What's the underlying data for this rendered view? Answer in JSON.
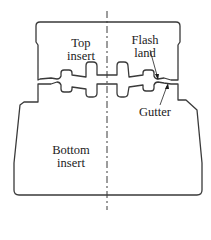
{
  "diagram": {
    "type": "closed-die forging cross-section",
    "labels": {
      "top_insert": [
        "Top",
        "insert"
      ],
      "bottom_insert": [
        "Bottom",
        "insert"
      ],
      "flash_land": [
        "Flash",
        "land"
      ],
      "gutter": "Gutter"
    },
    "colors": {
      "line": "#3a3a3a",
      "text": "#222222",
      "background": "#ffffff"
    }
  }
}
